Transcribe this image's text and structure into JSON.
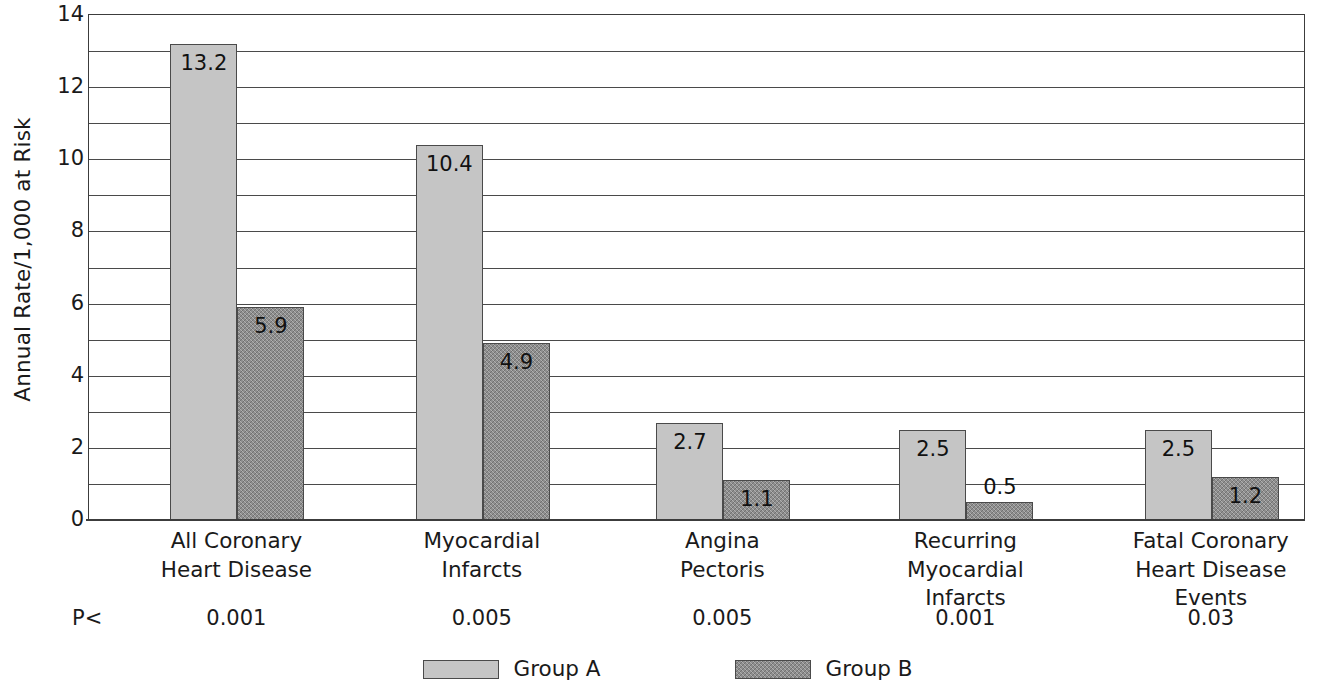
{
  "chart_data": {
    "type": "bar",
    "title": "",
    "xlabel": "",
    "ylabel": "Annual Rate/1,000 at Risk",
    "ylim": [
      0,
      14
    ],
    "ytick_step": 2,
    "gridline_step": 1,
    "grid": true,
    "legend_position": "bottom",
    "categories": [
      "All Coronary\nHeart Disease",
      "Myocardial\nInfarcts",
      "Angina\nPectoris",
      "Recurring\nMyocardial\nInfarcts",
      "Fatal Coronary\nHeart Disease\nEvents"
    ],
    "category_lines": [
      [
        "All Coronary",
        "Heart Disease"
      ],
      [
        "Myocardial",
        "Infarcts"
      ],
      [
        "Angina",
        "Pectoris"
      ],
      [
        "Recurring",
        "Myocardial",
        "Infarcts"
      ],
      [
        "Fatal Coronary",
        "Heart Disease",
        "Events"
      ]
    ],
    "series": [
      {
        "name": "Group A",
        "color": "#c5c5c5",
        "fill": "solid",
        "values": [
          13.2,
          10.4,
          2.7,
          2.5,
          2.5
        ]
      },
      {
        "name": "Group B",
        "color": "#8e8e8e",
        "fill": "crosshatch",
        "values": [
          5.9,
          4.9,
          1.1,
          0.5,
          1.2
        ]
      }
    ],
    "ytick_labels": [
      "0",
      "2",
      "4",
      "6",
      "8",
      "10",
      "12",
      "14"
    ],
    "ytick_values": [
      0,
      2,
      4,
      6,
      8,
      10,
      12,
      14
    ],
    "gridline_values": [
      1,
      2,
      3,
      4,
      5,
      6,
      7,
      8,
      9,
      10,
      11,
      12,
      13,
      14
    ],
    "annotations": {
      "p_prefix": "P<",
      "p_values": [
        "0.001",
        "0.005",
        "0.005",
        "0.001",
        "0.03"
      ]
    },
    "value_label_placement": [
      [
        "inside",
        "inside",
        "inside",
        "inside",
        "inside"
      ],
      [
        "inside",
        "inside",
        "inside",
        "outside",
        "inside"
      ]
    ]
  },
  "axis": {
    "y_title": "Annual Rate/1,000 at Risk"
  },
  "legend": {
    "entries": [
      {
        "label": "Group A",
        "style": "solid-light-gray"
      },
      {
        "label": "Group B",
        "style": "crosshatch-dark-gray"
      }
    ]
  },
  "colors": {
    "group_a": "#c5c5c5",
    "group_b": "#8e8e8e",
    "axis": "#3c3c3c",
    "grid": "#4a4a4a",
    "text": "#1a1a1a",
    "background": "#ffffff"
  }
}
